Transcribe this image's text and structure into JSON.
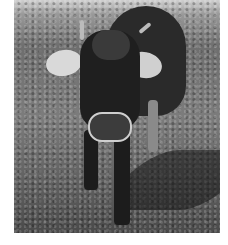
{
  "image": {
    "description": "Black-and-white photo of a young brown cow standing in a grassy field, facing the camera",
    "subject": "cow",
    "setting": "pasture",
    "tone": "grayscale"
  }
}
